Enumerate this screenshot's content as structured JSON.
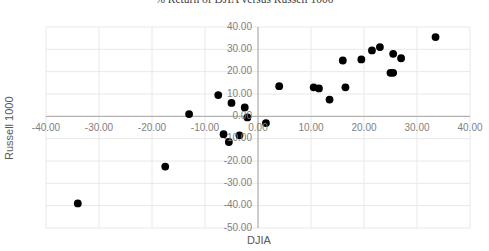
{
  "chart_data": {
    "type": "scatter",
    "title": "% Return of DJIA versus Russell 1000",
    "xlabel": "DJIA",
    "ylabel": "Russell 1000",
    "xlim": [
      -40,
      40
    ],
    "ylim": [
      -50,
      40
    ],
    "xticks": [
      -40,
      -30,
      -20,
      -10,
      0,
      10,
      20,
      30,
      40
    ],
    "xtick_labels": [
      "-40.00",
      "-30.00",
      "-20.00",
      "-10.00",
      "0.00",
      "10.00",
      "20.00",
      "30.00",
      "40.00"
    ],
    "yticks": [
      40,
      30,
      20,
      10,
      0,
      -10,
      -20,
      -30,
      -40,
      -50
    ],
    "ytick_labels": [
      "40.00",
      "30.00",
      "20.00",
      "10.00",
      "0.00",
      "-10.00",
      "-20.00",
      "-30.00",
      "-40.00",
      "-50.00"
    ],
    "grid": true,
    "legend": false,
    "marker_color": "#000000",
    "marker_size": 5.6,
    "axis_color": "#a6a6a6",
    "grid_color": "#e8e8e8",
    "series": [
      {
        "name": "Annual % return",
        "points": [
          [
            -34.0,
            -39.0
          ],
          [
            -17.5,
            -22.5
          ],
          [
            -13.0,
            1.0
          ],
          [
            -7.5,
            9.5
          ],
          [
            -6.5,
            -8.0
          ],
          [
            -5.5,
            -11.5
          ],
          [
            -5.0,
            6.0
          ],
          [
            -3.5,
            -8.5
          ],
          [
            -2.5,
            4.0
          ],
          [
            -2.0,
            -0.5
          ],
          [
            1.5,
            -3.0
          ],
          [
            4.0,
            13.5
          ],
          [
            10.5,
            13.0
          ],
          [
            11.5,
            12.5
          ],
          [
            13.5,
            7.5
          ],
          [
            16.5,
            13.0
          ],
          [
            16.0,
            25.0
          ],
          [
            19.5,
            25.5
          ],
          [
            21.5,
            29.5
          ],
          [
            23.0,
            31.0
          ],
          [
            25.0,
            19.5
          ],
          [
            25.5,
            19.5
          ],
          [
            25.5,
            28.0
          ],
          [
            27.0,
            26.0
          ],
          [
            33.5,
            35.5
          ]
        ]
      }
    ]
  }
}
